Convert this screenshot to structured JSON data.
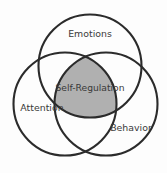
{
  "diagram": {
    "type": "venn-3-circle",
    "background_color": "#fdfdfd",
    "stroke_color": "#2b2b2b",
    "intersection_fill_color": "#b0b0b0",
    "label_color": "#3a3a3a",
    "circles": [
      {
        "id": "emotions",
        "label": "Emotions",
        "label_x": 90,
        "label_y": 34,
        "cx": 90,
        "cy": 66,
        "r": 51.5
      },
      {
        "id": "attention",
        "label": "Attention",
        "label_x": 42,
        "label_y": 108,
        "cx": 65,
        "cy": 104,
        "r": 51.5
      },
      {
        "id": "behavior",
        "label": "Behavior",
        "label_x": 131,
        "label_y": 128,
        "cx": 106,
        "cy": 104,
        "r": 51.5
      }
    ],
    "center": {
      "id": "self-regulation",
      "label": "Self-Regulation",
      "label_x": 90,
      "label_y": 88
    }
  }
}
